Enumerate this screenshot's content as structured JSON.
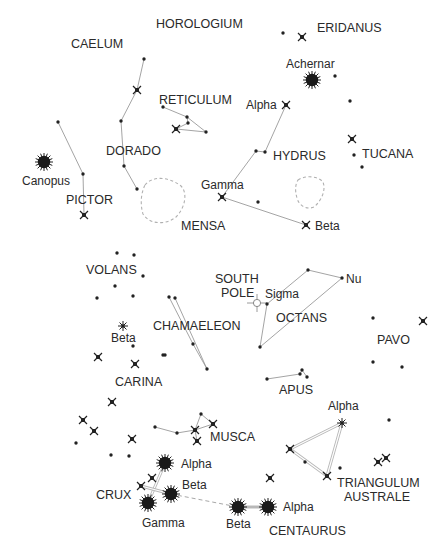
{
  "colors": {
    "ink": "#222222",
    "line": "#9a9a9a",
    "label": "#2a2a2a",
    "background": "#ffffff"
  },
  "constellations": [
    {
      "name": "HOROLOGIUM",
      "x": 156,
      "y": 28
    },
    {
      "name": "ERIDANUS",
      "x": 317,
      "y": 32
    },
    {
      "name": "CAELUM",
      "x": 71,
      "y": 48
    },
    {
      "name": "RETICULUM",
      "x": 159,
      "y": 104
    },
    {
      "name": "DORADO",
      "x": 106,
      "y": 155
    },
    {
      "name": "HYDRUS",
      "x": 273,
      "y": 160
    },
    {
      "name": "TUCANA",
      "x": 362,
      "y": 158
    },
    {
      "name": "PICTOR",
      "x": 66,
      "y": 204
    },
    {
      "name": "MENSA",
      "x": 181,
      "y": 230
    },
    {
      "name": "VOLANS",
      "x": 86,
      "y": 274
    },
    {
      "name": "SOUTH",
      "x": 215,
      "y": 283
    },
    {
      "name": "POLE",
      "x": 221,
      "y": 297
    },
    {
      "name": "OCTANS",
      "x": 276,
      "y": 322
    },
    {
      "name": "CHAMAELEON",
      "x": 153,
      "y": 330
    },
    {
      "name": "PAVO",
      "x": 377,
      "y": 344
    },
    {
      "name": "CARINA",
      "x": 115,
      "y": 386
    },
    {
      "name": "APUS",
      "x": 279,
      "y": 394
    },
    {
      "name": "MUSCA",
      "x": 210,
      "y": 441
    },
    {
      "name": "CRUX",
      "x": 96,
      "y": 499
    },
    {
      "name": "TRIANGULUM",
      "x": 337,
      "y": 487
    },
    {
      "name": "AUSTRALE",
      "x": 344,
      "y": 501
    },
    {
      "name": "CENTAURUS",
      "x": 269,
      "y": 535
    }
  ],
  "star_labels": [
    {
      "name": "Achernar",
      "x": 286,
      "y": 68
    },
    {
      "name": "Alpha",
      "x": 246,
      "y": 109
    },
    {
      "name": "Canopus",
      "x": 22,
      "y": 185
    },
    {
      "name": "Gamma",
      "x": 201,
      "y": 189
    },
    {
      "name": "Beta",
      "x": 315,
      "y": 230
    },
    {
      "name": "Nu",
      "x": 346,
      "y": 283
    },
    {
      "name": "Sigma",
      "x": 265,
      "y": 298
    },
    {
      "name": "Beta",
      "x": 111,
      "y": 342
    },
    {
      "name": "Alpha",
      "x": 328,
      "y": 410
    },
    {
      "name": "Alpha",
      "x": 181,
      "y": 468
    },
    {
      "name": "Beta",
      "x": 182,
      "y": 489
    },
    {
      "name": "Alpha",
      "x": 283,
      "y": 511
    },
    {
      "name": "Gamma",
      "x": 142,
      "y": 527
    },
    {
      "name": "Beta",
      "x": 226,
      "y": 528
    }
  ],
  "bright_stars": [
    {
      "name": "Achernar",
      "x": 312,
      "y": 80,
      "r": 6
    },
    {
      "name": "Canopus",
      "x": 44,
      "y": 162,
      "r": 6
    },
    {
      "name": "Crux Alpha",
      "x": 165,
      "y": 463,
      "r": 6
    },
    {
      "name": "Crux Beta",
      "x": 171,
      "y": 494,
      "r": 6
    },
    {
      "name": "Crux Gamma",
      "x": 148,
      "y": 503,
      "r": 6
    },
    {
      "name": "Centaurus Beta",
      "x": 238,
      "y": 507,
      "r": 6
    },
    {
      "name": "Centaurus Alpha",
      "x": 268,
      "y": 507,
      "r": 6
    }
  ],
  "cross_stars": [
    {
      "x": 302,
      "y": 37
    },
    {
      "x": 137,
      "y": 90
    },
    {
      "x": 176,
      "y": 129
    },
    {
      "x": 286,
      "y": 105
    },
    {
      "x": 352,
      "y": 139
    },
    {
      "x": 84,
      "y": 215
    },
    {
      "x": 222,
      "y": 197
    },
    {
      "x": 306,
      "y": 225
    },
    {
      "x": 423,
      "y": 321
    },
    {
      "x": 98,
      "y": 357
    },
    {
      "x": 135,
      "y": 364
    },
    {
      "x": 112,
      "y": 402
    },
    {
      "x": 83,
      "y": 420
    },
    {
      "x": 94,
      "y": 431
    },
    {
      "x": 132,
      "y": 439
    },
    {
      "x": 195,
      "y": 430
    },
    {
      "x": 213,
      "y": 424
    },
    {
      "x": 197,
      "y": 441
    },
    {
      "x": 152,
      "y": 478
    },
    {
      "x": 141,
      "y": 486
    },
    {
      "x": 290,
      "y": 449
    },
    {
      "x": 327,
      "y": 476
    },
    {
      "x": 270,
      "y": 478
    },
    {
      "x": 378,
      "y": 462
    },
    {
      "x": 386,
      "y": 458
    }
  ],
  "asterisk_stars": [
    {
      "x": 123,
      "y": 326
    },
    {
      "x": 342,
      "y": 423
    }
  ],
  "dots": [
    {
      "x": 283,
      "y": 33
    },
    {
      "x": 144,
      "y": 59
    },
    {
      "x": 335,
      "y": 76
    },
    {
      "x": 350,
      "y": 101
    },
    {
      "x": 58,
      "y": 122
    },
    {
      "x": 121,
      "y": 121
    },
    {
      "x": 163,
      "y": 107
    },
    {
      "x": 187,
      "y": 117
    },
    {
      "x": 188,
      "y": 123
    },
    {
      "x": 206,
      "y": 132
    },
    {
      "x": 83,
      "y": 174
    },
    {
      "x": 124,
      "y": 166
    },
    {
      "x": 137,
      "y": 189
    },
    {
      "x": 256,
      "y": 151
    },
    {
      "x": 265,
      "y": 152
    },
    {
      "x": 354,
      "y": 155
    },
    {
      "x": 362,
      "y": 167
    },
    {
      "x": 258,
      "y": 202
    },
    {
      "x": 117,
      "y": 253
    },
    {
      "x": 134,
      "y": 255
    },
    {
      "x": 143,
      "y": 276
    },
    {
      "x": 115,
      "y": 286
    },
    {
      "x": 97,
      "y": 298
    },
    {
      "x": 133,
      "y": 296
    },
    {
      "x": 169,
      "y": 297
    },
    {
      "x": 175,
      "y": 298
    },
    {
      "x": 163,
      "y": 355
    },
    {
      "x": 193,
      "y": 344
    },
    {
      "x": 207,
      "y": 369
    },
    {
      "x": 165,
      "y": 355
    },
    {
      "x": 308,
      "y": 270
    },
    {
      "x": 342,
      "y": 278
    },
    {
      "x": 267,
      "y": 304
    },
    {
      "x": 260,
      "y": 347
    },
    {
      "x": 373,
      "y": 318
    },
    {
      "x": 373,
      "y": 362
    },
    {
      "x": 402,
      "y": 367
    },
    {
      "x": 267,
      "y": 379
    },
    {
      "x": 300,
      "y": 374
    },
    {
      "x": 302,
      "y": 370
    },
    {
      "x": 307,
      "y": 377
    },
    {
      "x": 389,
      "y": 420
    },
    {
      "x": 76,
      "y": 443
    },
    {
      "x": 111,
      "y": 455
    },
    {
      "x": 129,
      "y": 456
    },
    {
      "x": 155,
      "y": 427
    },
    {
      "x": 177,
      "y": 433
    },
    {
      "x": 201,
      "y": 414
    },
    {
      "x": 305,
      "y": 462
    },
    {
      "x": 340,
      "y": 468
    },
    {
      "x": 133,
      "y": 346
    }
  ],
  "south_pole": {
    "x": 257,
    "y": 303
  }
}
